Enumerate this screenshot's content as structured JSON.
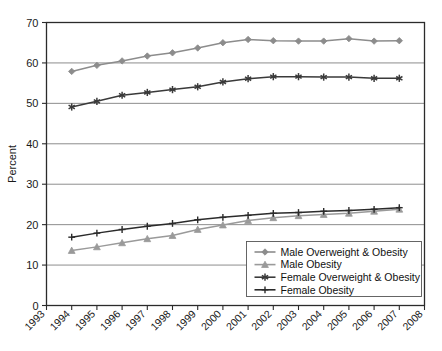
{
  "chart_data": {
    "type": "line",
    "title": "",
    "xlabel": "",
    "ylabel": "Percent",
    "grid": "horizontal",
    "legend_position": "inside-bottom-right",
    "xlim": [
      1993,
      2008
    ],
    "ylim": [
      0,
      70
    ],
    "yticks": [
      0,
      10,
      20,
      30,
      40,
      50,
      60,
      70
    ],
    "xticks": [
      1993,
      1994,
      1995,
      1996,
      1997,
      1998,
      1999,
      2000,
      2001,
      2002,
      2003,
      2004,
      2005,
      2006,
      2007,
      2008
    ],
    "x": [
      1994,
      1995,
      1996,
      1997,
      1998,
      1999,
      2000,
      2001,
      2002,
      2003,
      2004,
      2005,
      2006,
      2007
    ],
    "series": [
      {
        "name": "Male Overweight & Obesity",
        "marker": "diamond",
        "color": "#8c8c8c",
        "values": [
          57.9,
          59.4,
          60.5,
          61.7,
          62.5,
          63.7,
          65.0,
          65.8,
          65.5,
          65.4,
          65.4,
          66.0,
          65.4,
          65.5
        ]
      },
      {
        "name": "Male Obesity",
        "marker": "triangle",
        "color": "#9a9a9a",
        "values": [
          13.6,
          14.5,
          15.5,
          16.5,
          17.3,
          18.8,
          19.9,
          21.0,
          21.7,
          22.2,
          22.5,
          22.8,
          23.3,
          23.8
        ]
      },
      {
        "name": "Female Overweight & Obesity",
        "marker": "asterisk",
        "color": "#3a3a3a",
        "values": [
          49.1,
          50.5,
          52.0,
          52.7,
          53.4,
          54.1,
          55.3,
          56.1,
          56.6,
          56.6,
          56.5,
          56.5,
          56.2,
          56.2
        ]
      },
      {
        "name": "Female Obesity",
        "marker": "plus",
        "color": "#2b2b2b",
        "values": [
          16.9,
          17.9,
          18.8,
          19.6,
          20.3,
          21.2,
          21.8,
          22.3,
          22.8,
          23.0,
          23.3,
          23.5,
          23.8,
          24.2
        ]
      }
    ]
  },
  "axis": {
    "ylabel": "Percent",
    "ytick_labels": [
      "0",
      "10",
      "20",
      "30",
      "40",
      "50",
      "60",
      "70"
    ],
    "xtick_labels": [
      "1993",
      "1994",
      "1995",
      "1996",
      "1997",
      "1998",
      "1999",
      "2000",
      "2001",
      "2002",
      "2003",
      "2004",
      "2005",
      "2006",
      "2007",
      "2008"
    ]
  },
  "legend": {
    "entries": [
      {
        "label": "Male Overweight & Obesity"
      },
      {
        "label": "Male Obesity"
      },
      {
        "label": "Female Overweight & Obesity"
      },
      {
        "label": "Female Obesity"
      }
    ]
  }
}
